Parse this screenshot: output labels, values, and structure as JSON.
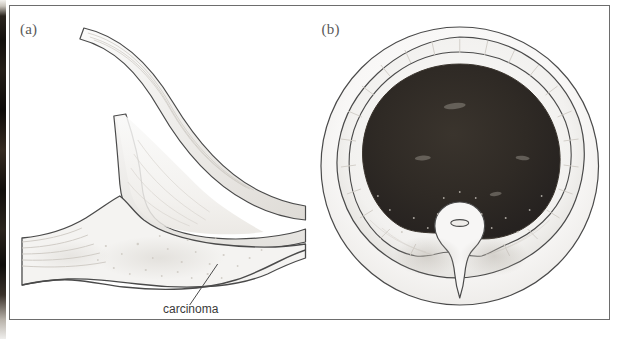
{
  "figure": {
    "panels": [
      {
        "id": "a",
        "label": "(a)",
        "view": "sagittal-section",
        "annotations": [
          {
            "name": "carcinoma-label",
            "text": "carcinoma"
          }
        ]
      },
      {
        "id": "b",
        "label": "(b)",
        "view": "axial-cross-section",
        "annotations": []
      }
    ]
  },
  "colors": {
    "frame_border": "#6d6d6d",
    "ink_outline": "#4a4a4a",
    "dark_mass_fill": "#2e2a26",
    "tissue_tint": "#f0efed",
    "shadow_tint": "#d8d6d2",
    "label_text": "#5a5a5a",
    "callout_text": "#3a3a3a",
    "page_background": "#ffffff",
    "scan_edge": "#1a1612"
  }
}
